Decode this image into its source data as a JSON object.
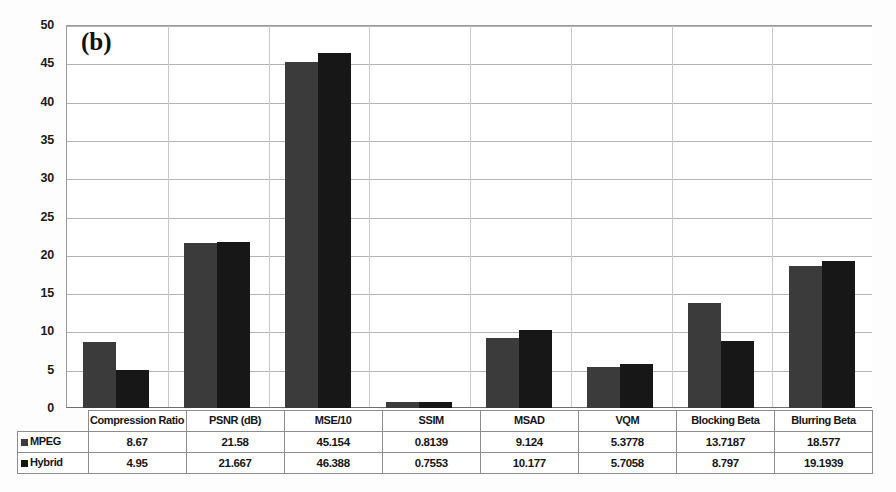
{
  "figure": {
    "panel_label": "(b)"
  },
  "chart_data": {
    "type": "bar",
    "title": "(b)",
    "xlabel": "",
    "ylabel": "",
    "ylim": [
      0,
      50
    ],
    "ytick_step": 5,
    "yticks": [
      "0",
      "5",
      "10",
      "15",
      "20",
      "25",
      "30",
      "35",
      "40",
      "45",
      "50"
    ],
    "grid": true,
    "legend_position": "table-left",
    "categories": [
      "Compression Ratio",
      "PSNR (dB)",
      "MSE/10",
      "SSIM",
      "MSAD",
      "VQM",
      "Blocking Beta",
      "Blurring Beta"
    ],
    "series": [
      {
        "name": "MPEG",
        "color": "#3b3b3b",
        "values": [
          8.67,
          21.58,
          45.154,
          0.8139,
          9.124,
          5.3778,
          13.7187,
          18.577
        ],
        "labels": [
          "8.67",
          "21.58",
          "45.154",
          "0.8139",
          "9.124",
          "5.3778",
          "13.7187",
          "18.577"
        ]
      },
      {
        "name": "Hybrid",
        "color": "#171717",
        "values": [
          4.95,
          21.667,
          46.388,
          0.7553,
          10.177,
          5.7058,
          8.797,
          19.1939
        ],
        "labels": [
          "4.95",
          "21.667",
          "46.388",
          "0.7553",
          "10.177",
          "5.7058",
          "8.797",
          "19.1939"
        ]
      }
    ]
  }
}
